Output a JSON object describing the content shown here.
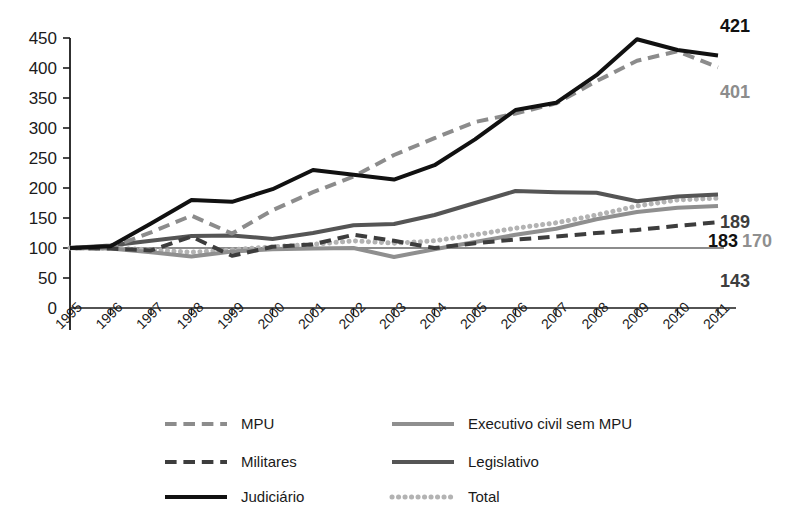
{
  "chart_data": {
    "type": "line",
    "title": "",
    "xlabel": "",
    "ylabel": "",
    "ylim": [
      0,
      450
    ],
    "ytick_step": 50,
    "yticks": [
      "0",
      "50",
      "100",
      "150",
      "200",
      "250",
      "300",
      "350",
      "400",
      "450"
    ],
    "grid": false,
    "legend_position": "bottom",
    "x": [
      "1995",
      "1996",
      "1997",
      "1998",
      "1999",
      "2000",
      "2001",
      "2002",
      "2003",
      "2004",
      "2005",
      "2006",
      "2007",
      "2008",
      "2009",
      "2010",
      "2011"
    ],
    "categories": [
      "1995",
      "1996",
      "1997",
      "1998",
      "1999",
      "2000",
      "2001",
      "2002",
      "2003",
      "2004",
      "2005",
      "2006",
      "2007",
      "2008",
      "2009",
      "2010",
      "2011"
    ],
    "series": [
      {
        "name": "MPU",
        "color": "#8c8c8c",
        "style": "dashed",
        "width": 4,
        "end_label": "401",
        "values": [
          100,
          101,
          126,
          154,
          124,
          163,
          193,
          219,
          255,
          283,
          310,
          324,
          341,
          378,
          412,
          428,
          401
        ]
      },
      {
        "name": "Militares",
        "color": "#3d3d3d",
        "style": "dashed",
        "width": 4,
        "end_label": "143",
        "values": [
          100,
          99,
          96,
          119,
          87,
          102,
          106,
          122,
          112,
          100,
          108,
          114,
          119,
          125,
          130,
          137,
          143
        ]
      },
      {
        "name": "Judiciário",
        "color": "#111111",
        "style": "solid",
        "width": 4,
        "end_label": "421",
        "values": [
          100,
          103,
          141,
          180,
          177,
          198,
          230,
          222,
          214,
          238,
          281,
          330,
          342,
          388,
          448,
          430,
          421
        ]
      },
      {
        "name": "Executivo civil sem MPU",
        "color": "#8f8f8f",
        "style": "solid",
        "width": 4,
        "end_label": "170",
        "values": [
          100,
          99,
          93,
          86,
          94,
          98,
          99,
          100,
          85,
          98,
          110,
          122,
          132,
          148,
          160,
          167,
          170
        ]
      },
      {
        "name": "Legislativo",
        "color": "#555555",
        "style": "solid",
        "width": 4,
        "end_label": "189",
        "values": [
          100,
          104,
          112,
          120,
          121,
          115,
          125,
          138,
          140,
          155,
          175,
          195,
          193,
          192,
          178,
          186,
          189
        ]
      },
      {
        "name": "Total",
        "color": "#b3b3b3",
        "style": "dotted",
        "width": 5,
        "end_label": "183",
        "values": [
          100,
          100,
          97,
          93,
          97,
          102,
          106,
          112,
          108,
          112,
          122,
          133,
          142,
          155,
          170,
          180,
          183
        ]
      }
    ],
    "end_labels": [
      {
        "text": "421",
        "color": "#111111",
        "x": 735,
        "y": 32
      },
      {
        "text": "401",
        "color": "#8c8c8c",
        "x": 735,
        "y": 98
      },
      {
        "text": "189",
        "color": "#3d3d3d",
        "x": 735,
        "y": 228
      },
      {
        "text": "183",
        "color": "#111111",
        "x": 723,
        "y": 247
      },
      {
        "text": "170",
        "color": "#8f8f8f",
        "x": 757,
        "y": 247
      },
      {
        "text": "143",
        "color": "#3d3d3d",
        "x": 735,
        "y": 287
      }
    ],
    "legend": [
      {
        "label": "MPU",
        "color": "#8c8c8c",
        "style": "dashed"
      },
      {
        "label": "Executivo civil sem MPU",
        "color": "#8f8f8f",
        "style": "solid"
      },
      {
        "label": "Militares",
        "color": "#3d3d3d",
        "style": "dashed"
      },
      {
        "label": "Legislativo",
        "color": "#555555",
        "style": "solid"
      },
      {
        "label": "Judiciário",
        "color": "#111111",
        "style": "solid"
      },
      {
        "label": "Total",
        "color": "#b3b3b3",
        "style": "dotted"
      }
    ]
  },
  "axis": {
    "y_tick_labels": [
      "450",
      "400",
      "350",
      "300",
      "250",
      "200",
      "150",
      "100",
      "50",
      "0"
    ],
    "x_tick_labels": [
      "1995",
      "1996",
      "1997",
      "1998",
      "1999",
      "2000",
      "2001",
      "2002",
      "2003",
      "2004",
      "2005",
      "2006",
      "2007",
      "2008",
      "2009",
      "2010",
      "2011"
    ]
  },
  "colors": {
    "background": "#ffffff",
    "axis": "#1a1a1a",
    "mpu": "#8c8c8c",
    "militares": "#3d3d3d",
    "judiciario": "#111111",
    "executivo": "#8f8f8f",
    "legislativo": "#555555",
    "total": "#b3b3b3"
  }
}
